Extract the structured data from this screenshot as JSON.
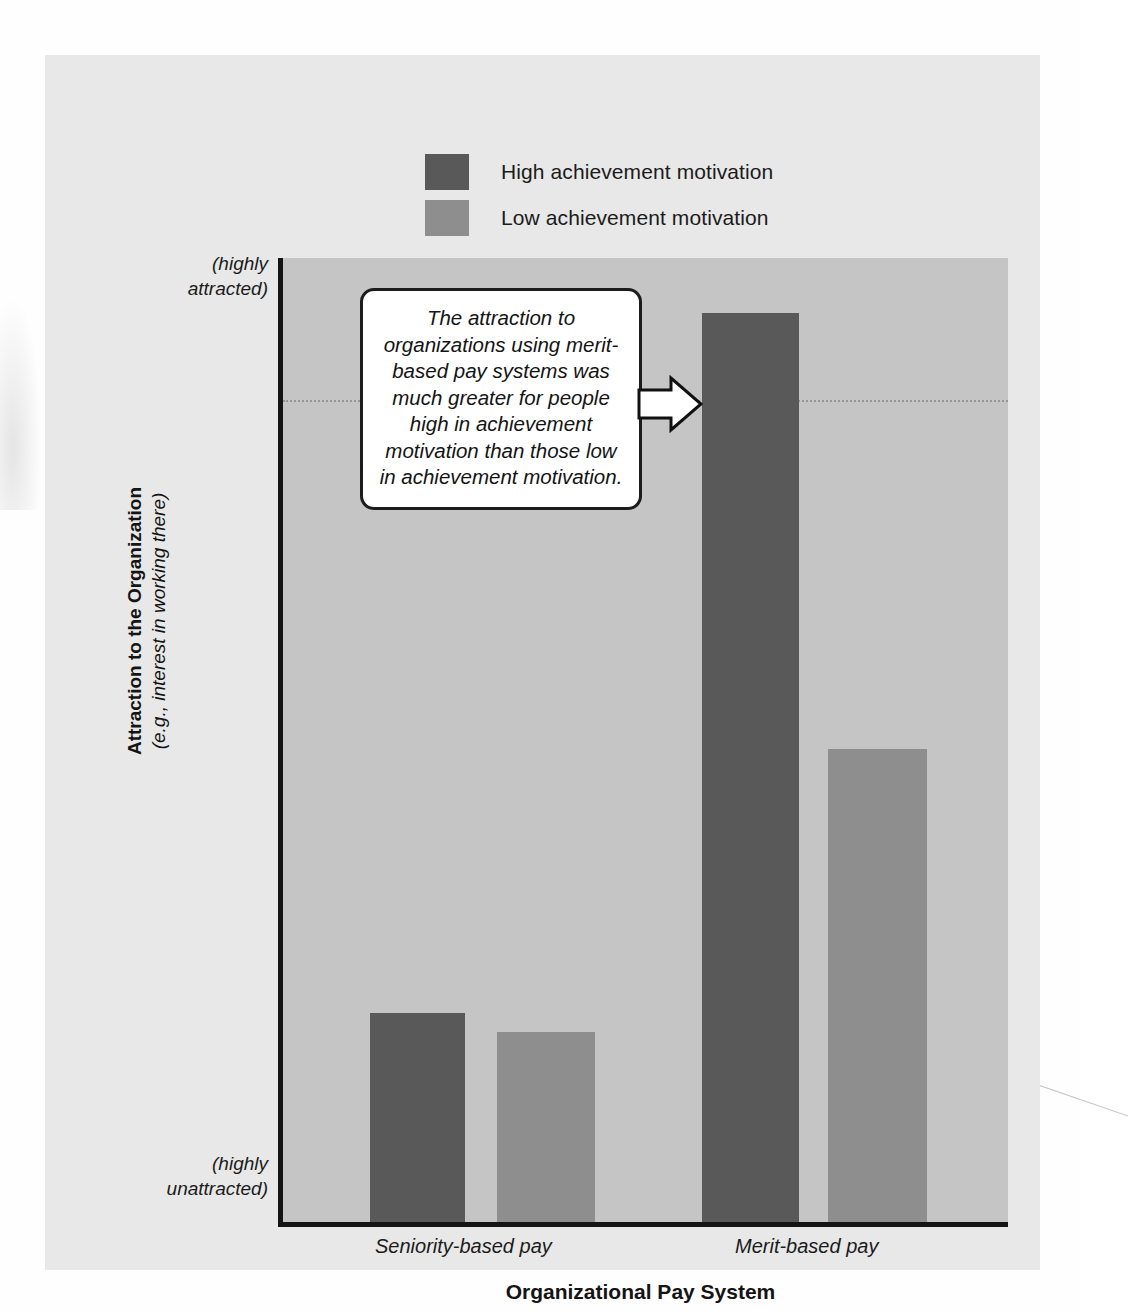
{
  "figure": {
    "panel_background": "#e8e8e8",
    "plot_background": "#c5c5c5"
  },
  "legend": {
    "position": "top-center",
    "items": [
      {
        "label": "High achievement motivation",
        "color": "#595959",
        "swatch_name": "legend-swatch-high"
      },
      {
        "label": "Low achievement motivation",
        "color": "#8e8e8e",
        "swatch_name": "legend-swatch-low"
      }
    ]
  },
  "axes": {
    "y_title_line1": "Attraction to the Organization",
    "y_title_line2": "(e.g., interest in working there)",
    "y_top_label": "(highly attracted)",
    "y_top_label_line1": "(highly",
    "y_top_label_line2": "attracted)",
    "y_bottom_label": "(highly unattracted)",
    "y_bottom_label_line1": "(highly",
    "y_bottom_label_line2": "unattracted)",
    "x_title": "Organizational Pay System",
    "x_tick_labels": [
      "Seniority-based pay",
      "Merit-based pay"
    ]
  },
  "callout": {
    "text": "The attraction to organizations using merit-based pay systems was much greater for people high in achievement motivation than those low in achievement motivation.",
    "arrow_direction": "right",
    "arrow_target": "high-achievement-merit-based-bar"
  },
  "chart_data": {
    "type": "bar",
    "title": "",
    "subtitle": "",
    "xlabel": "Organizational Pay System",
    "ylabel": "Attraction to the Organization (e.g., interest in working there)",
    "categories": [
      "Seniority-based pay",
      "Merit-based pay"
    ],
    "series": [
      {
        "name": "High achievement motivation",
        "color": "#595959",
        "values": [
          21.7,
          94.3
        ]
      },
      {
        "name": "Low achievement motivation",
        "color": "#8e8e8e",
        "values": [
          19.7,
          49.1
        ]
      }
    ],
    "ylim": [
      0,
      100
    ],
    "ytick_labels": [
      "(highly unattracted)",
      "(highly attracted)"
    ],
    "grid": true,
    "gridlines": [
      85.3
    ],
    "legend_position": "top-center",
    "units": "percent of axis height (qualitative scale, no numeric ticks shown)"
  }
}
